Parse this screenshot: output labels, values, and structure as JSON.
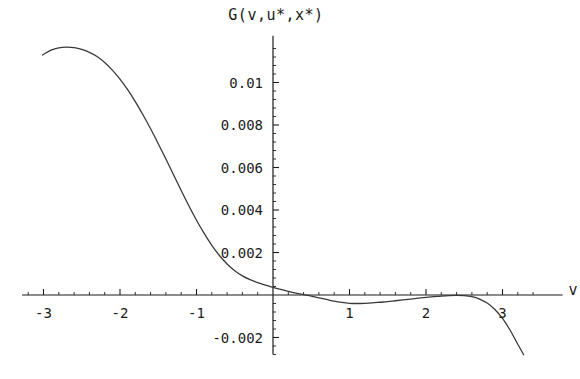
{
  "chart_data": {
    "type": "line",
    "title": "G(v,u*,x*)",
    "xlabel": "v",
    "ylabel": "",
    "xlim": [
      -3.28,
      3.55
    ],
    "ylim": [
      -0.0028,
      0.0122
    ],
    "grid": false,
    "legend": null,
    "x_ticks": [
      {
        "value": -3,
        "label": "-3"
      },
      {
        "value": -2,
        "label": "-2"
      },
      {
        "value": -1,
        "label": "-1"
      },
      {
        "value": 1,
        "label": "1"
      },
      {
        "value": 2,
        "label": "2"
      },
      {
        "value": 3,
        "label": "3"
      }
    ],
    "y_ticks": [
      {
        "value": 0.01,
        "label": "0.01"
      },
      {
        "value": 0.008,
        "label": "0.008"
      },
      {
        "value": 0.006,
        "label": "0.006"
      },
      {
        "value": 0.004,
        "label": "0.004"
      },
      {
        "value": 0.002,
        "label": "0.002"
      },
      {
        "value": -0.002,
        "label": "-0.002"
      }
    ],
    "x_minor_tick_step": 0.2,
    "y_minor_tick_step": 0.0004,
    "series": [
      {
        "name": "G(v,u*,x*)",
        "color": "#3a3a3a",
        "x": [
          -3.02,
          -2.9,
          -2.8,
          -2.7,
          -2.6,
          -2.5,
          -2.4,
          -2.3,
          -2.2,
          -2.1,
          -2.0,
          -1.9,
          -1.8,
          -1.7,
          -1.6,
          -1.5,
          -1.4,
          -1.3,
          -1.2,
          -1.1,
          -1.0,
          -0.9,
          -0.8,
          -0.7,
          -0.6,
          -0.5,
          -0.4,
          -0.3,
          -0.2,
          -0.1,
          0.0,
          0.1,
          0.2,
          0.3,
          0.4,
          0.5,
          0.6,
          0.7,
          0.8,
          0.9,
          1.0,
          1.1,
          1.2,
          1.3,
          1.4,
          1.5,
          1.6,
          1.7,
          1.8,
          1.9,
          2.0,
          2.1,
          2.2,
          2.3,
          2.4,
          2.5,
          2.6,
          2.7,
          2.8,
          2.9,
          3.0,
          3.1,
          3.2,
          3.28
        ],
        "y": [
          0.01128,
          0.01152,
          0.01163,
          0.01166,
          0.01164,
          0.01156,
          0.01142,
          0.01122,
          0.01094,
          0.01058,
          0.01016,
          0.00966,
          0.0091,
          0.00848,
          0.00782,
          0.00712,
          0.0064,
          0.00566,
          0.00492,
          0.0042,
          0.00352,
          0.0029,
          0.00234,
          0.00186,
          0.00146,
          0.00114,
          0.0009,
          0.00072,
          0.00058,
          0.00046,
          0.00036,
          0.00026,
          0.00017,
          9e-05,
          2e-05,
          -5e-05,
          -0.00013,
          -0.00021,
          -0.00029,
          -0.00035,
          -0.00039,
          -0.0004,
          -0.00039,
          -0.00037,
          -0.00034,
          -0.00031,
          -0.00027,
          -0.00023,
          -0.00019,
          -0.00015,
          -0.00011,
          -8e-05,
          -5e-05,
          -3e-05,
          -2e-05,
          -3e-05,
          -8e-05,
          -0.00019,
          -0.00038,
          -0.00068,
          -0.0011,
          -0.00166,
          -0.00232,
          -0.00283
        ]
      }
    ],
    "axis_color": "#1b1b1b",
    "background": "#ffffff"
  },
  "geometry": {
    "origin_px": {
      "x": 273,
      "y": 295
    },
    "x_unit_px": 76.5,
    "y_unit_px": 21250
  }
}
